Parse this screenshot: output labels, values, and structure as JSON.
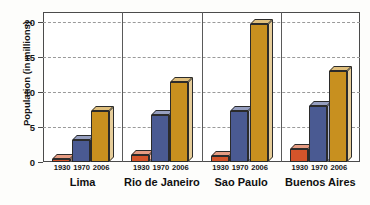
{
  "chart_data": {
    "type": "bar",
    "title": "",
    "xlabel": "",
    "ylabel": "Population (in millions)",
    "ylim": [
      0,
      21.5
    ],
    "yticks": [
      0,
      5,
      10,
      15,
      20
    ],
    "ytick_labels": [
      "0",
      "5",
      "10",
      "15",
      "20"
    ],
    "grid": true,
    "legend": "none",
    "categories": [
      "Lima",
      "Rio de Janeiro",
      "Sao Paulo",
      "Buenos Aires"
    ],
    "x": [
      "1930",
      "1970",
      "2006"
    ],
    "series": [
      {
        "name": "1930",
        "color": "#d4542a",
        "values": [
          0.4,
          1.0,
          0.9,
          1.8
        ]
      },
      {
        "name": "1970",
        "color": "#4a5a92",
        "values": [
          3.2,
          6.7,
          7.3,
          8.0
        ]
      },
      {
        "name": "2006",
        "color": "#c8901f",
        "values": [
          7.3,
          11.5,
          19.8,
          13.1
        ]
      }
    ]
  },
  "axis": {
    "ylabel": "Population (in millions)",
    "ytick_labels": [
      "0",
      "5",
      "10",
      "15",
      "20"
    ],
    "year_labels": [
      "1930",
      "1970",
      "2006"
    ],
    "city_labels": [
      "Lima",
      "Rio de Janeiro",
      "Sao Paulo",
      "Buenos Aires"
    ]
  },
  "colors": {
    "bar_1930": "#d4542a",
    "bar_1970": "#4a5a92",
    "bar_2006": "#c8901f",
    "bar_1930_top": "#e8apparent",
    "grid": "#9a9a9a",
    "axis": "#4b4b4b",
    "background": "#ffffff"
  }
}
